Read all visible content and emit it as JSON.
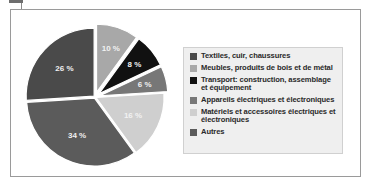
{
  "chart_data": {
    "type": "pie",
    "title": "",
    "categories": [
      "Meubles, produits de bois et de métal",
      "Transport: construction, assemblage et équipement",
      "Appareils électriques et électroniques",
      "Matériels et accessoires électriques et électroniques",
      "Autres",
      "Textiles, cuir, chaussures"
    ],
    "values": [
      10,
      8,
      6,
      16,
      34,
      26
    ],
    "value_labels": [
      "10 %",
      "8 %",
      "6 %",
      "16 %",
      "34 %",
      "26 %"
    ],
    "colors": [
      "#a8a8a8",
      "#111111",
      "#777777",
      "#cfcfcf",
      "#5b5b5b",
      "#4a4a4a"
    ],
    "exploded": [
      true,
      true,
      true,
      false,
      false,
      false
    ],
    "start_angle": "12 o'clock, clockwise",
    "legend_position": "right"
  },
  "legend": {
    "items": [
      {
        "label": "Textiles, cuir, chaussures",
        "color": "#4a4a4a"
      },
      {
        "label": "Meubles, produits de bois et de métal",
        "color": "#a8a8a8"
      },
      {
        "label": "Transport: construction, assemblage et équipement",
        "color": "#111111"
      },
      {
        "label": "Appareils électriques et électroniques",
        "color": "#777777"
      },
      {
        "label": "Matériels et accessoires électriques et électroniques",
        "color": "#cfcfcf"
      },
      {
        "label": "Autres",
        "color": "#5b5b5b"
      }
    ]
  }
}
